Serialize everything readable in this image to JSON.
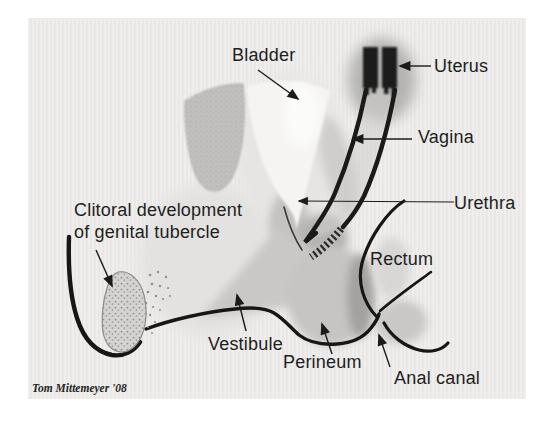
{
  "figure": {
    "kind": "anatomical-diagram",
    "credit": "Tom Mittemeyer '08",
    "labels": {
      "bladder": "Bladder",
      "uterus": "Uterus",
      "vagina": "Vagina",
      "urethra": "Urethra",
      "clitoral_line1": "Clitoral development",
      "clitoral_line2": "of genital tubercle",
      "rectum": "Rectum",
      "vestibule": "Vestibule",
      "perineum": "Perineum",
      "anal_canal": "Anal canal"
    },
    "colors": {
      "page_background": "#ffffff",
      "canvas": "#edecea",
      "ink": "#1e1e1e",
      "shade_light": "#dddcda",
      "shade_mid": "#c6c5c3",
      "shade_dark": "#a3a2a0",
      "stipple_dot": "#8f8e8c",
      "tube": "#1a1a1a"
    }
  }
}
